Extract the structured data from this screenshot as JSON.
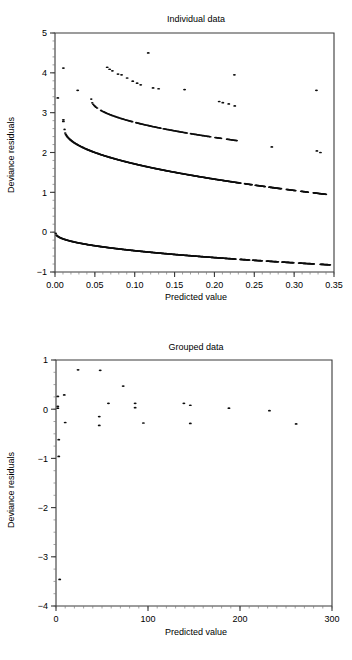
{
  "figure": {
    "panels": [
      "Individual data",
      "Grouped data"
    ],
    "shared_ylabel": "Deviance residuals",
    "shared_xlabel": "Predicted value"
  },
  "chart_data": [
    {
      "type": "scatter",
      "title": "Individual data",
      "xlabel": "Predicted value",
      "ylabel": "Deviance residuals",
      "xlim": [
        0.0,
        0.35
      ],
      "ylim": [
        -1,
        5
      ],
      "xticks": [
        0.0,
        0.05,
        0.1,
        0.15,
        0.2,
        0.25,
        0.3,
        0.35
      ],
      "xticklabels": [
        "0.00",
        "0.05",
        "0.10",
        "0.15",
        "0.20",
        "0.25",
        "0.30",
        "0.35"
      ],
      "yticks": [
        -1,
        0,
        1,
        2,
        3,
        4,
        5
      ],
      "yticklabels": [
        "−1",
        "0",
        "1",
        "2",
        "3",
        "4",
        "5"
      ],
      "grid": false,
      "legend": false,
      "marker": "dot",
      "series": [
        {
          "name": "outcome-1-upper-branch",
          "comment": "sparse high deviance residual points for rare events",
          "points": [
            [
              0.0105,
              4.12
            ],
            [
              0.0035,
              3.37
            ],
            [
              0.0105,
              2.82
            ],
            [
              0.0105,
              2.78
            ],
            [
              0.0285,
              3.56
            ],
            [
              0.0655,
              4.14
            ],
            [
              0.0685,
              4.09
            ],
            [
              0.072,
              4.05
            ],
            [
              0.079,
              3.97
            ],
            [
              0.0835,
              3.95
            ],
            [
              0.0905,
              3.87
            ],
            [
              0.0975,
              3.79
            ],
            [
              0.103,
              3.74
            ],
            [
              0.1075,
              3.7
            ],
            [
              0.117,
              4.5
            ],
            [
              0.123,
              3.62
            ],
            [
              0.13,
              3.6
            ],
            [
              0.1625,
              3.58
            ],
            [
              0.206,
              3.28
            ],
            [
              0.2105,
              3.25
            ],
            [
              0.218,
              3.22
            ],
            [
              0.2255,
              3.17
            ],
            [
              0.225,
              3.95
            ],
            [
              0.272,
              2.14
            ],
            [
              0.328,
              3.56
            ],
            [
              0.3285,
              2.04
            ],
            [
              0.333,
              2.0
            ]
          ]
        },
        {
          "name": "outcome-1-main-branch",
          "comment": "dense decreasing arc from ~3.35 down to ~2.3",
          "curve": {
            "x_start": 0.0455,
            "x_end": 0.228,
            "y_start": 3.34,
            "y_end": 2.3,
            "n": 150,
            "gaps": [
              [
                0.053,
                0.0575
              ],
              [
                0.098,
                0.101
              ],
              [
                0.133,
                0.136
              ],
              [
                0.166,
                0.17
              ],
              [
                0.196,
                0.2
              ],
              [
                0.209,
                0.215
              ]
            ]
          }
        },
        {
          "name": "outcome-1-dense-curve",
          "comment": "thick dense curve from 2.58 at x~0.012 down to ~0.95 at x~0.34",
          "curve": {
            "x_start": 0.012,
            "x_end": 0.34,
            "y_start": 2.58,
            "y_end": 0.95,
            "n": 420,
            "gaps": [
              [
                0.233,
                0.238
              ],
              [
                0.247,
                0.251
              ],
              [
                0.264,
                0.268
              ],
              [
                0.284,
                0.29
              ],
              [
                0.302,
                0.308
              ],
              [
                0.318,
                0.324
              ]
            ]
          }
        },
        {
          "name": "outcome-0-dense-curve",
          "comment": "thick dense curve from -0.03 at x~0 down to ~-0.82 at x~0.345",
          "curve": {
            "x_start": 0.001,
            "x_end": 0.345,
            "y_start": -0.03,
            "y_end": -0.82,
            "n": 460,
            "gaps": [
              [
                0.227,
                0.232
              ],
              [
                0.244,
                0.248
              ],
              [
                0.26,
                0.265
              ],
              [
                0.28,
                0.285
              ],
              [
                0.3,
                0.306
              ],
              [
                0.325,
                0.333
              ]
            ]
          }
        }
      ]
    },
    {
      "type": "scatter",
      "title": "Grouped data",
      "xlabel": "Predicted value",
      "ylabel": "Deviance residuals",
      "xlim": [
        0,
        300
      ],
      "ylim": [
        -4,
        1
      ],
      "xticks": [
        0,
        100,
        200,
        300
      ],
      "xticklabels": [
        "0",
        "100",
        "200",
        "300"
      ],
      "yticks": [
        -4,
        -3,
        -2,
        -1,
        0,
        1
      ],
      "yticklabels": [
        "−4",
        "−3",
        "−2",
        "−1",
        "0",
        "1"
      ],
      "grid": false,
      "legend": false,
      "marker": "dot",
      "series": [
        {
          "name": "grouped-deviance-residuals",
          "points": [
            [
              2,
              0.26
            ],
            [
              2,
              0.06
            ],
            [
              2,
              0.02
            ],
            [
              3,
              -0.62
            ],
            [
              3,
              -0.96
            ],
            [
              9,
              0.29
            ],
            [
              10,
              -0.27
            ],
            [
              4,
              -3.46
            ],
            [
              24,
              0.8
            ],
            [
              48,
              0.79
            ],
            [
              47,
              -0.15
            ],
            [
              47,
              -0.33
            ],
            [
              57,
              0.12
            ],
            [
              73,
              0.47
            ],
            [
              86,
              0.12
            ],
            [
              86,
              0.03
            ],
            [
              95,
              -0.28
            ],
            [
              139,
              0.12
            ],
            [
              146,
              0.08
            ],
            [
              146,
              -0.29
            ],
            [
              188,
              0.02
            ],
            [
              232,
              -0.03
            ],
            [
              261,
              -0.3
            ]
          ]
        }
      ]
    }
  ]
}
